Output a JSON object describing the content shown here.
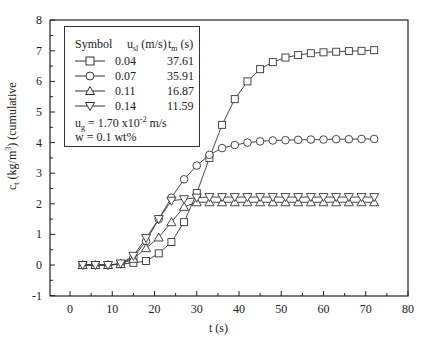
{
  "chart_data": {
    "type": "line",
    "title": "",
    "xlabel": "t (s)",
    "ylabel": "c_t (kg/m^3) (cumulative",
    "xlim": [
      -5,
      80
    ],
    "ylim": [
      -1,
      8
    ],
    "xticks": [
      0,
      10,
      20,
      30,
      40,
      50,
      60,
      70,
      80
    ],
    "yticks": [
      -1,
      0,
      1,
      2,
      3,
      4,
      5,
      6,
      7,
      8
    ],
    "grid": false,
    "legend_position": "upper left",
    "x": [
      3,
      6,
      9,
      12,
      15,
      18,
      21,
      24,
      27,
      30,
      33,
      36,
      39,
      42,
      45,
      48,
      51,
      54,
      57,
      60,
      63,
      66,
      69,
      72
    ],
    "series": [
      {
        "name": "0.04",
        "marker": "square",
        "u_sl": "0.04",
        "t_m": "37.61",
        "values": [
          0,
          0,
          0,
          0.03,
          0.07,
          0.13,
          0.38,
          0.75,
          1.4,
          2.35,
          3.5,
          4.58,
          5.42,
          6.0,
          6.4,
          6.63,
          6.78,
          6.86,
          6.92,
          6.95,
          6.97,
          6.99,
          7.0,
          7.02
        ]
      },
      {
        "name": "0.07",
        "marker": "circle",
        "u_sl": "0.07",
        "t_m": "35.91",
        "values": [
          0,
          0,
          0,
          0.03,
          0.25,
          0.78,
          1.5,
          2.2,
          2.8,
          3.25,
          3.6,
          3.82,
          3.92,
          4.0,
          4.04,
          4.07,
          4.08,
          4.09,
          4.1,
          4.1,
          4.11,
          4.11,
          4.12,
          4.12
        ]
      },
      {
        "name": "0.11",
        "marker": "triangle-up",
        "u_sl": "0.11",
        "t_m": "16.87",
        "values": [
          0,
          0,
          0,
          0.03,
          0.2,
          0.55,
          0.9,
          1.4,
          1.9,
          2.05,
          2.05,
          2.05,
          2.05,
          2.05,
          2.05,
          2.05,
          2.05,
          2.05,
          2.05,
          2.05,
          2.05,
          2.05,
          2.05,
          2.05
        ]
      },
      {
        "name": "0.14",
        "marker": "triangle-down",
        "u_sl": "0.14",
        "t_m": "11.59",
        "values": [
          0,
          0,
          0,
          0.05,
          0.3,
          0.88,
          1.5,
          2.1,
          2.15,
          2.2,
          2.22,
          2.22,
          2.22,
          2.22,
          2.22,
          2.22,
          2.22,
          2.22,
          2.22,
          2.22,
          2.22,
          2.22,
          2.22,
          2.22
        ]
      }
    ],
    "annotations": [
      "u_g = 1.70 x10^-2 m/s",
      "w = 0.1 wt%"
    ]
  },
  "axes": {
    "xlabel": "t (s)",
    "ylabel_main": "c",
    "ylabel_sub": "t",
    "ylabel_unit": " (kg/m",
    "ylabel_sup": "3",
    "ylabel_tail": ") (cumulative"
  },
  "legend": {
    "header_symbol": "Symbol",
    "header_u": "u",
    "header_u_sub": "sl",
    "header_u_unit": " (m/s)",
    "header_t": "t",
    "header_t_sub": "m",
    "header_t_unit": " (s)",
    "rows": [
      {
        "u": "0.04",
        "t": "37.61"
      },
      {
        "u": "0.07",
        "t": "35.91"
      },
      {
        "u": "0.11",
        "t": "16.87"
      },
      {
        "u": "0.14",
        "t": "11.59"
      }
    ],
    "note1_main": "u",
    "note1_sub": "g",
    "note1_rest": "  = 1.70 x10",
    "note1_sup": "-2",
    "note1_tail": " m/s",
    "note2": "w   = 0.1 wt%"
  },
  "style": {
    "line_color": "#333333",
    "marker_fill": "#ffffff",
    "axis_color": "#222222"
  }
}
